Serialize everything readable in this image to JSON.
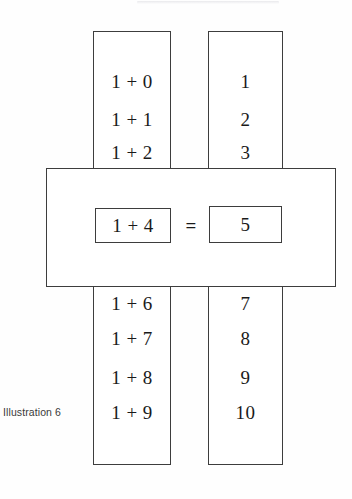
{
  "figure": {
    "caption": "Illustration 6",
    "line_color": "#3d3d3d",
    "background_color": "#fefefe",
    "text_color": "#1a1a1a"
  },
  "columns": {
    "expression_header": "",
    "result_header": ""
  },
  "rows_above": [
    {
      "expression": "1 + 0",
      "result": "1"
    },
    {
      "expression": "1 + 1",
      "result": "2"
    },
    {
      "expression": "1 + 2",
      "result": "3"
    }
  ],
  "highlighted": {
    "expression": "1 + 4",
    "operator": "=",
    "result": "5"
  },
  "rows_below": [
    {
      "expression": "1 + 6",
      "result": "7"
    },
    {
      "expression": "1 + 7",
      "result": "8"
    },
    {
      "expression": "1 + 8",
      "result": "9"
    },
    {
      "expression": "1 + 9",
      "result": "10"
    }
  ]
}
